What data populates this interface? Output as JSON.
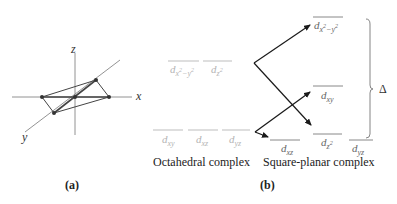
{
  "panel_a": {
    "label": "(a)",
    "axes": {
      "x": "x",
      "y": "y",
      "z": "z"
    }
  },
  "panel_b": {
    "label": "(b)",
    "octahedral": {
      "caption": "Octahedral complex",
      "upper": [
        {
          "d": "d",
          "sub": "x",
          "sup1": "2",
          "mid": "−y",
          "sup2": "2"
        },
        {
          "d": "d",
          "sub": "z",
          "sup": "2"
        }
      ],
      "lower": [
        {
          "d": "d",
          "sub": "xy"
        },
        {
          "d": "d",
          "sub": "xz"
        },
        {
          "d": "d",
          "sub": "yz"
        }
      ]
    },
    "square_planar": {
      "caption": "Square-planar complex",
      "levels": [
        {
          "d": "d",
          "sub": "x",
          "sup1": "2",
          "mid": "−y",
          "sup2": "2"
        },
        {
          "d": "d",
          "sub": "xy"
        },
        {
          "d": "d",
          "sub": "z",
          "sup": "2"
        },
        {
          "d": "d",
          "sub": "xz"
        },
        {
          "d": "d",
          "sub": "yz"
        }
      ],
      "splitting_label": "Δ"
    },
    "colors": {
      "octahedral_levels": "#b4b4b4",
      "square_levels": "#888888",
      "arrows": "#1a1a1a"
    }
  }
}
